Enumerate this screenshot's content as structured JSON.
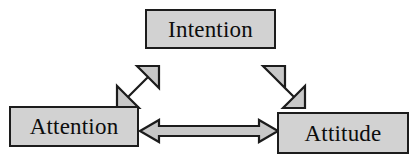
{
  "diagram": {
    "background_color": "#ffffff",
    "node_fill_color": "#d2d2d2",
    "node_border_color": "#1c1c1c",
    "arrow_fill_color": "#c8c8c8",
    "arrow_outline_color": "#1c1c1c",
    "nodes": [
      {
        "id": "intention",
        "label": "Intention",
        "position": "top-center"
      },
      {
        "id": "attention",
        "label": "Attention",
        "position": "bottom-left"
      },
      {
        "id": "attitude",
        "label": "Attitude",
        "position": "bottom-right"
      }
    ],
    "connectors": [
      {
        "id": "attention-intention",
        "from": "Attention",
        "to": "Intention",
        "style": "double-headed-block-arrow",
        "orientation": "diagonal-up-right"
      },
      {
        "id": "intention-attitude",
        "from": "Intention",
        "to": "Attitude",
        "style": "double-headed-block-arrow",
        "orientation": "diagonal-down-right"
      },
      {
        "id": "attention-attitude",
        "from": "Attention",
        "to": "Attitude",
        "style": "double-headed-block-arrow",
        "orientation": "horizontal"
      }
    ]
  }
}
